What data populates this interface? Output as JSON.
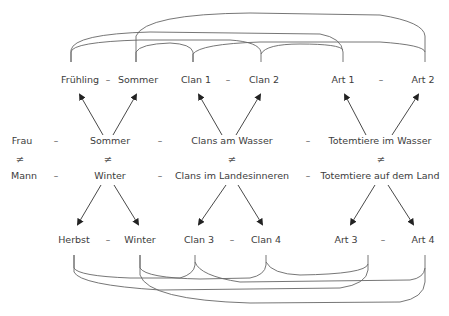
{
  "diagram": {
    "top_row": {
      "seasons": [
        "Frühling",
        "Sommer"
      ],
      "clans": [
        "Clan 1",
        "Clan 2"
      ],
      "species": [
        "Art 1",
        "Art 2"
      ]
    },
    "middle": {
      "row1": [
        "Frau",
        "Sommer",
        "Clans am Wasser",
        "Totemtiere im Wasser"
      ],
      "row2": [
        "Mann",
        "Winter",
        "Clans im Landesinneren",
        "Totemtiere auf dem Land"
      ],
      "opposition_symbol": "≠",
      "separator": "–"
    },
    "bottom_row": {
      "seasons": [
        "Herbst",
        "Winter"
      ],
      "clans": [
        "Clan 3",
        "Clan 4"
      ],
      "species": [
        "Art 3",
        "Art 4"
      ]
    },
    "line_color": "#555555",
    "arrow_color": "#222222"
  }
}
